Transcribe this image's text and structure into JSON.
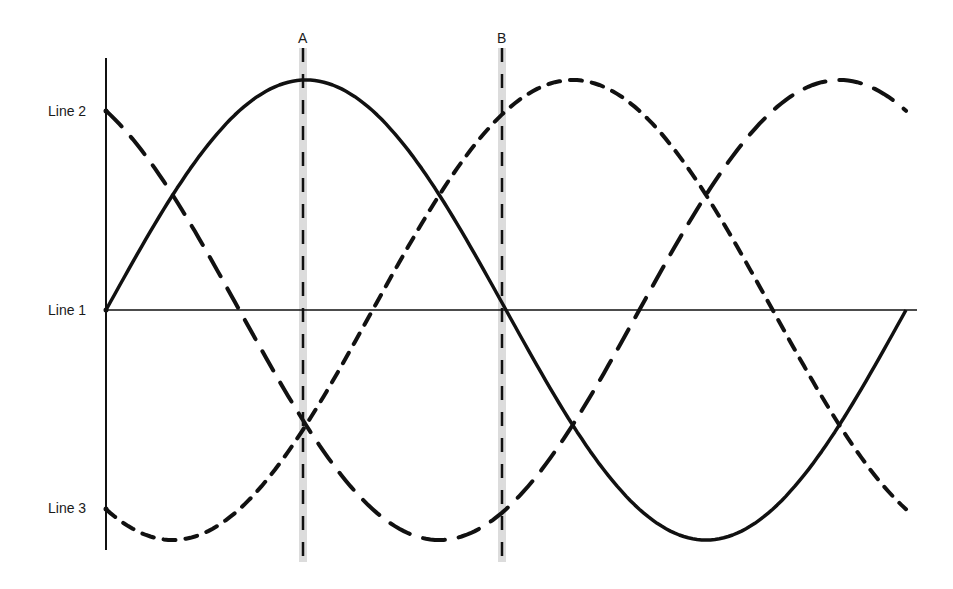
{
  "diagram": {
    "title": "",
    "labels": {
      "line1": "Line 1",
      "line2": "Line 2",
      "line3": "Line 3",
      "marker_a": "A",
      "marker_b": "B"
    },
    "colors": {
      "ink": "#111111",
      "marker_band": "#d9d9d9",
      "background": "#ffffff"
    }
  },
  "chart_data": {
    "type": "line",
    "title": "",
    "xlabel": "",
    "ylabel": "",
    "x_unit": "electrical degrees (implied)",
    "x": [
      0,
      30,
      60,
      90,
      120,
      150,
      180,
      210,
      240,
      270,
      300,
      330,
      360
    ],
    "series": [
      {
        "name": "Line 1",
        "style": "solid",
        "values": [
          0,
          0.5,
          0.866,
          1,
          0.866,
          0.5,
          0,
          -0.5,
          -0.866,
          -1,
          -0.866,
          -0.5,
          0
        ]
      },
      {
        "name": "Line 2",
        "style": "long-dash",
        "values": [
          0.866,
          0.5,
          0,
          -0.5,
          -0.866,
          -1,
          -0.866,
          -0.5,
          0,
          0.5,
          0.866,
          1,
          0.866
        ]
      },
      {
        "name": "Line 3",
        "style": "short-dash",
        "values": [
          -0.866,
          -1,
          -0.866,
          -0.5,
          0,
          0.5,
          0.866,
          1,
          0.866,
          0.5,
          0,
          -0.5,
          -0.866
        ]
      }
    ],
    "markers": [
      {
        "label": "A",
        "x": 90
      },
      {
        "label": "B",
        "x": 180
      }
    ],
    "ylim": [
      -1,
      1
    ],
    "xlim": [
      0,
      360
    ],
    "grid": false,
    "legend": "none (lines labelled on left axis)"
  }
}
